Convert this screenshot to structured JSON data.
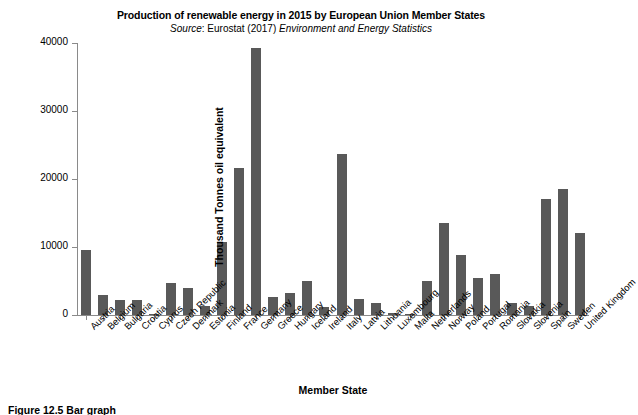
{
  "chart_data": {
    "type": "bar",
    "title": "Production of renewable energy in 2015 by European Union Member States",
    "subtitle_source_label": "Source",
    "subtitle_middle": ": Eurostat (2017) ",
    "subtitle_italic": "Environment and Energy Statistics",
    "xlabel": "Member State",
    "ylabel": "Thousand Tonnes oil equivalent",
    "ylim": [
      0,
      40000
    ],
    "yticks": [
      0,
      10000,
      20000,
      30000,
      40000
    ],
    "ytick_labels": [
      "0",
      "10000",
      "20000",
      "30000",
      "40000"
    ],
    "grid": false,
    "legend": null,
    "bar_color": "#595959",
    "axis_color": "#8a8a8a",
    "categories": [
      "Austria",
      "Belgium",
      "Bulgaria",
      "Croatia",
      "Cyprus",
      "Czech Republic",
      "Denmark",
      "Estonia",
      "Finland",
      "France",
      "Germany",
      "Greece",
      "Hungary",
      "Iceland",
      "Ireland",
      "Italy",
      "Latvia",
      "Lithuania",
      "Luxembourg",
      "Malta",
      "Netherlands",
      "Norway",
      "Poland",
      "Portugal",
      "Romania",
      "Slovakia",
      "Slovenia",
      "Spain",
      "Sweden",
      "United Kingdom"
    ],
    "values": [
      9500,
      3000,
      2200,
      2200,
      150,
      4700,
      3900,
      1300,
      10700,
      21600,
      39200,
      2700,
      3200,
      5000,
      1200,
      23700,
      2400,
      1700,
      250,
      100,
      5000,
      13600,
      8800,
      5500,
      6000,
      1700,
      1300,
      17100,
      18500,
      12000
    ]
  },
  "caption": {
    "text": "Figure 12.5 Bar graph"
  }
}
